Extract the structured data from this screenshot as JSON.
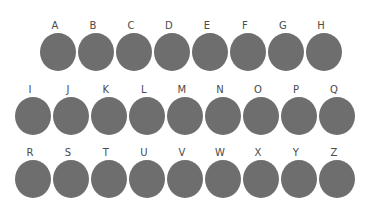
{
  "page": {
    "background_color": "#ffffff",
    "disc_color": "#6e6e6e",
    "label_color": "#4a4a4a"
  },
  "grid": {
    "rows": [
      {
        "name": "row-1",
        "left": 40,
        "top": 20,
        "gap": 2,
        "disc_width": 36,
        "disc_height": 38,
        "items": [
          {
            "label": "A"
          },
          {
            "label": "B"
          },
          {
            "label": "C"
          },
          {
            "label": "D"
          },
          {
            "label": "E"
          },
          {
            "label": "F"
          },
          {
            "label": "G"
          },
          {
            "label": "H"
          }
        ]
      },
      {
        "name": "row-2",
        "left": 15,
        "top": 84,
        "gap": 2,
        "disc_width": 36,
        "disc_height": 38,
        "items": [
          {
            "label": "I"
          },
          {
            "label": "J"
          },
          {
            "label": "K"
          },
          {
            "label": "L"
          },
          {
            "label": "M"
          },
          {
            "label": "N"
          },
          {
            "label": "O"
          },
          {
            "label": "P"
          },
          {
            "label": "Q"
          }
        ]
      },
      {
        "name": "row-3",
        "left": 15,
        "top": 147,
        "gap": 2,
        "disc_width": 36,
        "disc_height": 38,
        "items": [
          {
            "label": "R"
          },
          {
            "label": "S"
          },
          {
            "label": "T"
          },
          {
            "label": "U"
          },
          {
            "label": "V"
          },
          {
            "label": "W"
          },
          {
            "label": "X"
          },
          {
            "label": "Y"
          },
          {
            "label": "Z"
          }
        ]
      }
    ]
  }
}
